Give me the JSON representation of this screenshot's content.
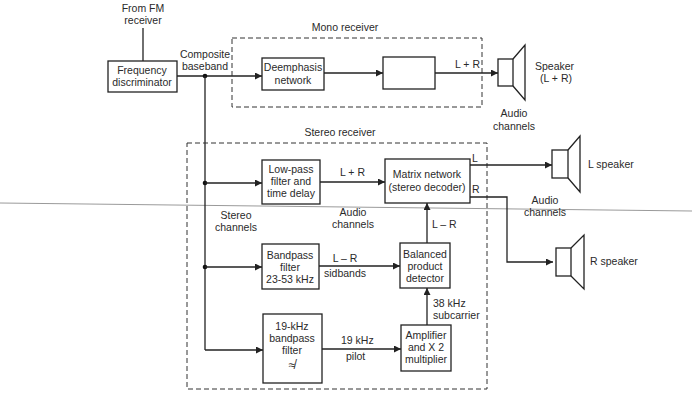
{
  "diagram": {
    "input_label": [
      "From FM",
      "receiver"
    ],
    "composite_label": [
      "Composite",
      "baseband"
    ],
    "mono_receiver": {
      "title": "Mono receiver",
      "blocks": {
        "deemphasis": [
          "Deemphasis",
          "network"
        ],
        "unlabeled_block": ""
      },
      "output_label": "L + R"
    },
    "stereo_receiver": {
      "title": "Stereo receiver",
      "blocks": {
        "lowpass": [
          "Low-pass",
          "filter and",
          "time delay"
        ],
        "matrix": [
          "Matrix network",
          "(stereo decoder)"
        ],
        "bandpass": [
          "Bandpass",
          "filter",
          "23-53 kHz"
        ],
        "balanced": [
          "Balanced",
          "product",
          "detector"
        ],
        "pilot_filter": [
          "19-kHz",
          "bandpass",
          "filter"
        ],
        "amplifier": [
          "Amplifier",
          "and X 2",
          "multiplier"
        ]
      },
      "signals": {
        "lpf_out": "L + R",
        "bpf_out": [
          "L – R",
          "sidbands"
        ],
        "detector_out": "L – R",
        "subcarrier": [
          "38 kHz",
          "subcarrier"
        ],
        "pilot": [
          "19 kHz",
          "pilot"
        ],
        "matrix_L": "L",
        "matrix_R": "R"
      },
      "stereo_channels_label": [
        "Stereo",
        "channels"
      ],
      "audio_channels_label": [
        "Audio",
        "channels"
      ],
      "filter_symbol": "≉"
    },
    "discriminator": [
      "Frequency",
      "discriminator"
    ],
    "speakers": {
      "mono": [
        "Speaker",
        "(L + R)"
      ],
      "left": "L speaker",
      "right": "R speaker"
    },
    "audio_channels_top": [
      "Audio",
      "channels"
    ],
    "audio_channels_right": [
      "Audio",
      "channels"
    ]
  }
}
